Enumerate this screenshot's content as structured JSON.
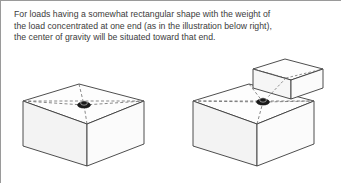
{
  "panel": {
    "border_color": "#9a9a9a",
    "background_color": "#ffffff"
  },
  "caption": {
    "text": "For loads having a somewhat rectangular shape with the weight of\nthe load concentrated at one end (as in the illustration below right),\nthe center of gravity will be situated toward that end.",
    "color": "#3b3b3b"
  },
  "illustrations": {
    "line_color": "#3a3a3a",
    "dashed_color": "#6b6b6b",
    "face_top_color": "#fdfdfd",
    "face_left_color": "#f4f4f4",
    "face_front_color": "#fafafa",
    "marker_color": "#1a1a1a",
    "left_figure": {
      "name": "uniform-rectangular-load",
      "description": "Rectangular box with center of gravity at the center of the top face",
      "cog_label": "center-of-gravity marker"
    },
    "right_figure": {
      "name": "end-weighted-load",
      "description": "Rectangular box with a raised block at the right end and center of gravity shifted toward that end",
      "cog_label": "center-of-gravity marker"
    }
  }
}
